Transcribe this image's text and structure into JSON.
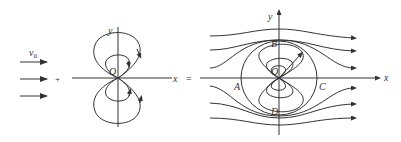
{
  "figure": {
    "stroke_color": "#333333",
    "background": "#ffffff",
    "panels": [
      {
        "name": "uniform-flow",
        "velocity_label": "v",
        "velocity_subscript": "0",
        "arrow_count": 3
      },
      {
        "name": "plus",
        "operator": "+"
      },
      {
        "name": "doublet",
        "origin_label": "O",
        "x_axis_label": "x",
        "y_axis_label": "y"
      },
      {
        "name": "equals",
        "operator": "="
      },
      {
        "name": "cylinder-flow",
        "origin_label": "O",
        "x_axis_label": "x",
        "y_axis_label": "y",
        "point_labels": [
          "A",
          "B",
          "C",
          "D"
        ]
      }
    ]
  }
}
